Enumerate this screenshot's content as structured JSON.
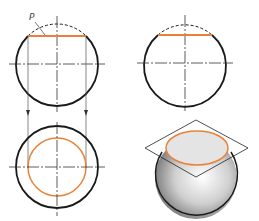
{
  "diagram": {
    "colors": {
      "outline": "#1a1a1a",
      "section": "#e8823a",
      "centerline": "#333333",
      "projection": "#555555",
      "plane": "#222222"
    },
    "labels": {
      "plane": "P"
    },
    "views": [
      {
        "name": "front-view",
        "center": [
          57,
          64
        ],
        "radius": 41,
        "section_line": {
          "y": 36,
          "x1": 28,
          "x2": 86
        }
      },
      {
        "name": "side-view",
        "center": [
          185,
          64
        ],
        "radius": 41,
        "section_line": {
          "y": 35,
          "x1": 158,
          "x2": 212
        }
      },
      {
        "name": "top-view",
        "center": [
          57,
          167
        ],
        "radius": 41,
        "section_circle_radius": 29
      },
      {
        "name": "isometric-view",
        "center": [
          196,
          178
        ],
        "radius": 41,
        "plane_points": [
          [
            196,
            120
          ],
          [
            248,
            148
          ],
          [
            196,
            177
          ],
          [
            145,
            148
          ]
        ],
        "section_ellipse": {
          "cx": 197,
          "cy": 148,
          "rx": 31,
          "ry": 17
        }
      }
    ]
  }
}
